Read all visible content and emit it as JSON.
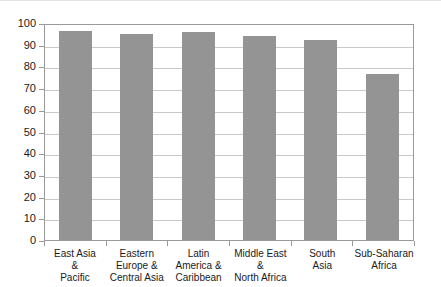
{
  "chart_data": {
    "type": "bar",
    "title": "",
    "xlabel": "",
    "ylabel": "",
    "categories": [
      "East Asia\n&\nPacific",
      "Eastern\nEurope &\nCentral Asia",
      "Latin\nAmerica &\nCaribbean",
      "Middle East\n&\nNorth Africa",
      "South\nAsia",
      "Sub-Saharan\nAfrica"
    ],
    "values": [
      96.5,
      95,
      96,
      94,
      92,
      76.5
    ],
    "ylim": [
      0,
      100
    ],
    "yticks": [
      0,
      10,
      20,
      30,
      40,
      50,
      60,
      70,
      80,
      90,
      100
    ],
    "ytick_labels": [
      "0",
      "10",
      "20",
      "30",
      "40",
      "50",
      "60",
      "70",
      "80",
      "90",
      "100"
    ],
    "grid": true,
    "legend": "none",
    "bar_color": "#949494",
    "gridline_color": "#c9c9c9",
    "axis_color": "#9a9a9a",
    "text_color": "#1a1a1a"
  }
}
